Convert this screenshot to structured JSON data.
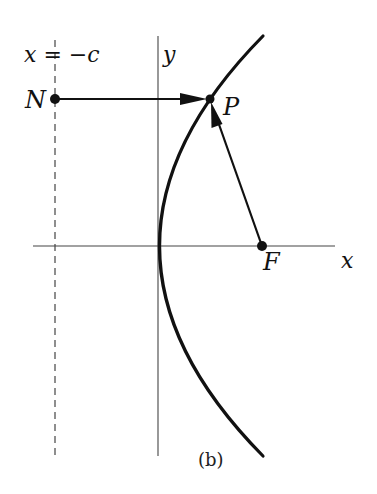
{
  "diagram": {
    "type": "parabola-focus-directrix",
    "labels": {
      "directrix": "x = −c",
      "y_axis": "y",
      "x_axis": "x",
      "point_N": "N",
      "point_P": "P",
      "point_F": "F",
      "caption": "(b)"
    },
    "colors": {
      "ink": "#111111",
      "axis": "#444444",
      "background": "#ffffff"
    },
    "geometry": {
      "directrix_x": 55,
      "y_axis_x": 158,
      "x_axis_y": 246,
      "N": [
        55,
        99
      ],
      "P": [
        210,
        99
      ],
      "F": [
        262,
        246
      ],
      "vertex": [
        159,
        246
      ]
    }
  }
}
